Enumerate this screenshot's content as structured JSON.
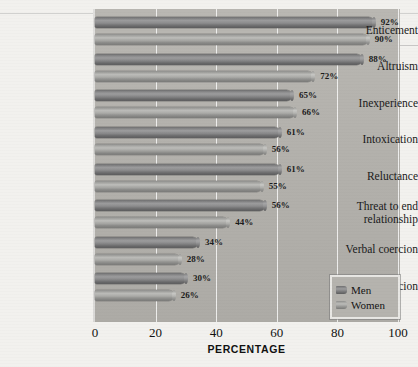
{
  "chart_data": {
    "type": "bar",
    "orientation": "horizontal",
    "title": "",
    "xlabel": "PERCENTAGE",
    "ylabel": "",
    "xlim": [
      0,
      100
    ],
    "xticks": [
      0,
      20,
      40,
      60,
      80,
      100
    ],
    "grid": "vertical",
    "legend_position": "bottom-right",
    "categories": [
      "Enticement",
      "Altruism",
      "Inexperience",
      "Intoxication",
      "Reluctance",
      "Threat to end relationship",
      "Verbal coercion",
      "Physical coercion"
    ],
    "series": [
      {
        "name": "Men",
        "color": "#6f6f70",
        "values": [
          92,
          88,
          65,
          61,
          61,
          56,
          34,
          30
        ],
        "labels": [
          "92%",
          "88%",
          "65%",
          "61%",
          "61%",
          "56%",
          "34%",
          "30%"
        ]
      },
      {
        "name": "Women",
        "color": "#a9a9a6",
        "values": [
          90,
          72,
          66,
          56,
          55,
          44,
          28,
          26
        ],
        "labels": [
          "90%",
          "72%",
          "66%",
          "56%",
          "55%",
          "44%",
          "28%",
          "26%"
        ]
      }
    ]
  },
  "axis": {
    "x_title": "PERCENTAGE",
    "tick_labels": [
      "0",
      "20",
      "40",
      "60",
      "80",
      "100"
    ]
  },
  "category_labels": [
    {
      "line1": "Enticement",
      "line2": ""
    },
    {
      "line1": "Altruism",
      "line2": ""
    },
    {
      "line1": "Inexperience",
      "line2": ""
    },
    {
      "line1": "Intoxication",
      "line2": ""
    },
    {
      "line1": "Reluctance",
      "line2": ""
    },
    {
      "line1": "Threat to end",
      "line2": "relationship"
    },
    {
      "line1": "Verbal coercion",
      "line2": ""
    },
    {
      "line1": "Physical coercion",
      "line2": ""
    }
  ],
  "legend": {
    "items": [
      {
        "label": "Men",
        "color": "#6f6f70"
      },
      {
        "label": "Women",
        "color": "#a9a9a6"
      }
    ]
  }
}
